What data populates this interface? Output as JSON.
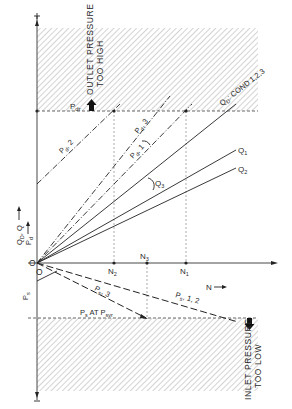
{
  "diagram": {
    "type": "pump operating characteristic diagram",
    "axes": {
      "vertical_up_label_1": "Q",
      "vertical_up_label_1_sub": "D",
      "vertical_up_label_1_rest": ", Q",
      "vertical_up_label_2": "P",
      "vertical_up_label_2_sub": "d",
      "vertical_down_label": "P",
      "vertical_down_label_sub": "s",
      "horizontal_label": "N",
      "origin_label_upper": "O",
      "origin_label_lower": "O"
    },
    "zones": {
      "upper": {
        "line1": "OUTLET PRESSURE",
        "line2": "TOO HIGH",
        "limit_label": "P",
        "limit_sub": "dr"
      },
      "lower": {
        "line1": "INLET PRESSURE",
        "line2": "TOO LOW",
        "limit_label": "P",
        "limit_sub": "s",
        "limit_rest": " AT P",
        "limit_sub2": "svr"
      }
    },
    "speed_marks": [
      {
        "label": "N",
        "sub": "2"
      },
      {
        "label": "N",
        "sub": "3"
      },
      {
        "label": "N",
        "sub": "1"
      }
    ],
    "curves": [
      {
        "label": "Q",
        "sub": "D",
        "rest": ": COND 1,2,3",
        "style": "solid"
      },
      {
        "label": "Q",
        "sub": "1",
        "rest": "",
        "style": "solid"
      },
      {
        "label": "Q",
        "sub": "2",
        "rest": "",
        "style": "solid"
      },
      {
        "label": "Q",
        "sub": "3",
        "rest": "",
        "style": "solid"
      },
      {
        "label": "P",
        "sub": "d",
        "rest": ", 1",
        "style": "dash-dot"
      },
      {
        "label": "P",
        "sub": "d",
        "rest": ", 2",
        "style": "dash-dot"
      },
      {
        "label": "P",
        "sub": "d",
        "rest": ", 3",
        "style": "dash-dot"
      },
      {
        "label": "P",
        "sub": "s",
        "rest": ", 1, 2",
        "style": "dashed"
      },
      {
        "label": "P",
        "sub": "s",
        "rest": ", 3",
        "style": "dashed"
      }
    ]
  },
  "colors": {
    "ink": "#2a2a2a",
    "hatch": "#9a9a9a",
    "guide": "#8a8a8a",
    "background": "#ffffff"
  }
}
